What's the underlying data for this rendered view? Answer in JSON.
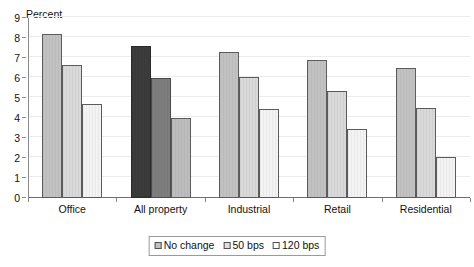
{
  "chart_data": {
    "type": "bar",
    "title": "",
    "subtitle": "",
    "xlabel": "",
    "ylabel": "Percent",
    "ylim": [
      0,
      9
    ],
    "ytick_labels": [
      "0",
      "1",
      "2",
      "3",
      "4",
      "5",
      "6",
      "7",
      "8",
      "9"
    ],
    "ytick_values": [
      0,
      1,
      2,
      3,
      4,
      5,
      6,
      7,
      8,
      9
    ],
    "grid": true,
    "legend_position": "bottom-center",
    "categories": [
      "Office",
      "All property",
      "Industrial",
      "Retail",
      "Residential"
    ],
    "series": [
      {
        "name": "No change",
        "values": [
          8.2,
          7.6,
          7.3,
          6.9,
          6.5
        ]
      },
      {
        "name": "50 bps",
        "values": [
          6.65,
          6.0,
          6.05,
          5.35,
          4.5
        ]
      },
      {
        "name": "120 bps",
        "values": [
          4.7,
          4.0,
          4.45,
          3.45,
          2.05
        ]
      }
    ],
    "highlight_category": "All property",
    "colors": {
      "series_no_change": "#c2c2c2",
      "series_50_bps": "#d9d9d9",
      "series_120_bps": "#f3f3f3",
      "highlight_no_change": "#3b3b3b",
      "highlight_50_bps": "#7e7e7e",
      "highlight_120_bps": "#bdbdbd",
      "bar_outline": "#5b5b5b",
      "axis": "#8a8a8a",
      "gridline": "#ebebeb",
      "text": "#111111",
      "background": "#ffffff"
    }
  },
  "legend": {
    "items": [
      {
        "label": "No change"
      },
      {
        "label": "50 bps"
      },
      {
        "label": "120 bps"
      }
    ]
  }
}
